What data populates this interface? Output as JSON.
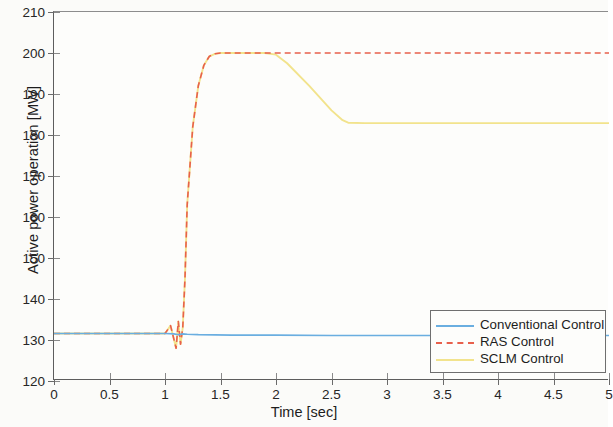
{
  "chart_data": {
    "type": "line",
    "title": "",
    "xlabel": "Time [sec]",
    "ylabel": "Active power operation [MW]",
    "xlim": [
      0,
      5
    ],
    "ylim": [
      120,
      210
    ],
    "xticks": [
      0,
      0.5,
      1,
      1.5,
      2,
      2.5,
      3,
      3.5,
      4,
      4.5,
      5
    ],
    "xtick_labels": [
      "0",
      "0.5",
      "1",
      "1.5",
      "2",
      "2.5",
      "3",
      "3.5",
      "4",
      "4.5",
      "5"
    ],
    "yticks": [
      120,
      130,
      140,
      150,
      160,
      170,
      180,
      190,
      200,
      210
    ],
    "ytick_labels": [
      "120",
      "130",
      "140",
      "150",
      "160",
      "170",
      "180",
      "190",
      "200",
      "210"
    ],
    "grid": false,
    "legend_position": "lower right",
    "series": [
      {
        "name": "Conventional Control",
        "color": "#6aaee0",
        "style": "solid",
        "x": [
          0,
          0.5,
          1.0,
          1.08,
          1.12,
          1.16,
          1.2,
          1.3,
          1.6,
          2.0,
          2.5,
          3.0,
          3.5,
          4.0,
          4.5,
          5.0
        ],
        "y": [
          131.6,
          131.6,
          131.6,
          131.5,
          131.3,
          131.5,
          131.4,
          131.3,
          131.2,
          131.2,
          131.1,
          131.1,
          131.1,
          131.1,
          131.1,
          131.1
        ]
      },
      {
        "name": "RAS Control",
        "color": "#e8604c",
        "style": "dashed",
        "x": [
          0,
          0.5,
          1.0,
          1.05,
          1.1,
          1.12,
          1.14,
          1.16,
          1.18,
          1.2,
          1.25,
          1.3,
          1.35,
          1.4,
          1.45,
          1.5,
          2.0,
          2.5,
          3.0,
          3.5,
          4.0,
          4.5,
          5.0
        ],
        "y": [
          131.6,
          131.6,
          131.6,
          133.5,
          128.0,
          134.5,
          129.0,
          133.0,
          145.0,
          163.0,
          182.0,
          192.0,
          197.0,
          199.2,
          199.8,
          200.0,
          200.0,
          200.0,
          200.0,
          200.0,
          200.0,
          200.0,
          200.0
        ]
      },
      {
        "name": "SCLM Control",
        "color": "#f2e38c",
        "style": "solid",
        "x": [
          0,
          0.5,
          1.0,
          1.05,
          1.1,
          1.12,
          1.14,
          1.16,
          1.18,
          1.2,
          1.25,
          1.3,
          1.35,
          1.4,
          1.45,
          1.5,
          1.9,
          2.0,
          2.1,
          2.3,
          2.5,
          2.6,
          2.65,
          2.8,
          3.0,
          3.5,
          4.0,
          4.5,
          5.0
        ],
        "y": [
          131.6,
          131.6,
          131.6,
          133.5,
          128.0,
          134.5,
          129.0,
          133.0,
          145.0,
          163.0,
          182.0,
          192.0,
          197.0,
          199.2,
          199.8,
          200.0,
          200.0,
          199.6,
          197.5,
          192.0,
          186.0,
          183.6,
          183.0,
          182.9,
          182.9,
          182.9,
          182.9,
          182.9,
          182.9
        ]
      }
    ],
    "annotations": {
      "step_event_time": 1.1,
      "ras_settled_value": 200,
      "sclm_settled_value": 183,
      "baseline_value": 131.6
    }
  },
  "legend": {
    "items": [
      {
        "label": "Conventional Control",
        "color": "#6aaee0",
        "style": "solid"
      },
      {
        "label": "RAS Control",
        "color": "#e8604c",
        "style": "dashed"
      },
      {
        "label": "SCLM Control",
        "color": "#f2e38c",
        "style": "solid"
      }
    ]
  }
}
